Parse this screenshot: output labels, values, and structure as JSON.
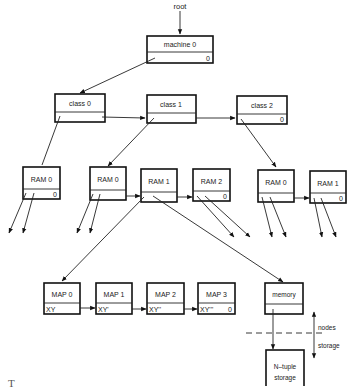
{
  "root_label": "root",
  "machine": {
    "name": "machine 0",
    "field": "0"
  },
  "classes": [
    {
      "name": "class 0",
      "field": ""
    },
    {
      "name": "class 1",
      "field": ""
    },
    {
      "name": "class 2",
      "field": "0"
    }
  ],
  "rams": [
    {
      "name": "RAM 0",
      "field": "0",
      "parent": "class 0"
    },
    {
      "name": "RAM 0",
      "field": "",
      "parent": "class 1"
    },
    {
      "name": "RAM 1",
      "field": "",
      "parent": "class 1"
    },
    {
      "name": "RAM 2",
      "field": "0",
      "parent": "class 1"
    },
    {
      "name": "RAM 0",
      "field": "",
      "parent": "class 2"
    },
    {
      "name": "RAM 1",
      "field": "0",
      "parent": "class 2"
    }
  ],
  "maps": [
    {
      "name": "MAP 0",
      "field": "XY"
    },
    {
      "name": "MAP 1",
      "field": "XY'"
    },
    {
      "name": "MAP 2",
      "field": "XY''"
    },
    {
      "name": "MAP 3",
      "field": "XY'''",
      "terminator": "0"
    }
  ],
  "memory": {
    "name": "memory",
    "field": ""
  },
  "storage": {
    "line1": "N–tuple",
    "line2": "storage"
  },
  "boundary": {
    "upper": "nodes",
    "lower": "storage"
  },
  "caption": "T                 "
}
